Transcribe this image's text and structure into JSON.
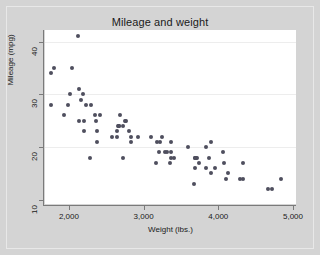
{
  "figure": {
    "background_color": "#d4d4d4",
    "panel_color": "#ffffff",
    "marker_color": "#4f4f5e",
    "grid_color": "#ededed",
    "axis_color": "#7a7a7a"
  },
  "chart_data": {
    "type": "scatter",
    "title": "Mileage and weight",
    "xlabel": "Weight (lbs.)",
    "ylabel": "Mileage (mpg)",
    "xlim": [
      1680,
      5040
    ],
    "ylim": [
      9.2,
      42.2
    ],
    "xticks": [
      2000,
      3000,
      4000,
      5000
    ],
    "xticklabels": [
      "2,000",
      "3,000",
      "4,000",
      "5,000"
    ],
    "yticks": [
      10,
      20,
      30,
      40
    ],
    "yticklabels": [
      "10",
      "20",
      "30",
      "40"
    ],
    "grid": "horizontal",
    "gridlines_y": [
      20,
      30,
      40
    ],
    "legend": null,
    "marker_shape": "circle",
    "n_points": 74,
    "series": [
      {
        "name": "Mileage vs weight",
        "x": [
          2930,
          3350,
          2640,
          3250,
          4080,
          3670,
          2230,
          3280,
          3880,
          3400,
          4330,
          3900,
          4290,
          4330,
          3900,
          4840,
          4720,
          3830,
          2580,
          4060,
          3720,
          3370,
          2830,
          3370,
          2670,
          3700,
          3690,
          3180,
          3220,
          4130,
          3600,
          3740,
          3210,
          3960,
          3830,
          4100,
          4670,
          3310,
          3690,
          3370,
          2730,
          3100,
          2800,
          3690,
          2360,
          2300,
          2730,
          2770,
          2690,
          2200,
          2350,
          2640,
          1800,
          1760,
          2020,
          2130,
          2750,
          2420,
          2830,
          2120,
          2650,
          2370,
          2160,
          2040,
          1930,
          1990,
          3170,
          2190,
          2200,
          2670,
          2370,
          2280,
          2130,
          1760
        ],
        "y": [
          22,
          17,
          22,
          22,
          17,
          13,
          28,
          19,
          18,
          18,
          17,
          15,
          14,
          14,
          21,
          14,
          12,
          16,
          22,
          19,
          18,
          19,
          21,
          18,
          24,
          18,
          18,
          21,
          21,
          15,
          20,
          17,
          19,
          16,
          20,
          14,
          12,
          19,
          18,
          21,
          24,
          22,
          23,
          16,
          25,
          28,
          18,
          25,
          26,
          25,
          26,
          23,
          35,
          34,
          30,
          31,
          25,
          26,
          22,
          41,
          24,
          21,
          29,
          35,
          26,
          28,
          17,
          30,
          23,
          24,
          23,
          18,
          25,
          28
        ]
      }
    ]
  }
}
